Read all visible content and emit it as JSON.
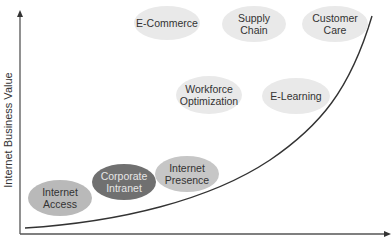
{
  "diagram": {
    "y_axis_label": "Internet Business Value",
    "curve": "exponential growth curve",
    "colors": {
      "axis": "#555555",
      "curve": "#333333",
      "bubble_light": "#e9e9e9",
      "bubble_mid": "#b9b9b9",
      "bubble_medium": "#a3a3a3",
      "bubble_dark": "#707070"
    },
    "bubbles": [
      {
        "id": "internet-access",
        "line1": "Internet",
        "line2": "Access"
      },
      {
        "id": "corporate-intranet",
        "line1": "Corporate",
        "line2": "Intranet"
      },
      {
        "id": "internet-presence",
        "line1": "Internet",
        "line2": "Presence"
      },
      {
        "id": "workforce-optimization",
        "line1": "Workforce",
        "line2": "Optimization"
      },
      {
        "id": "e-learning",
        "line1": "E-Learning",
        "line2": ""
      },
      {
        "id": "e-commerce",
        "line1": "E-Commerce",
        "line2": ""
      },
      {
        "id": "supply-chain",
        "line1": "Supply",
        "line2": "Chain"
      },
      {
        "id": "customer-care",
        "line1": "Customer",
        "line2": "Care"
      }
    ]
  }
}
